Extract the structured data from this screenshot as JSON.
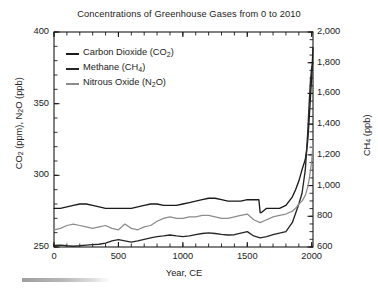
{
  "chart_data": {
    "type": "line",
    "title": "Concentrations of Greenhouse Gases from 0 to 2010",
    "xlabel": "Year, CE",
    "ylabel_left": "CO2 (ppm), N2O (ppb)",
    "ylabel_right": "CH4 (ppb)",
    "xlim": [
      0,
      2010
    ],
    "ylim_left": [
      250,
      400
    ],
    "ylim_right": [
      600,
      2000
    ],
    "xticks": [
      0,
      500,
      1000,
      1500,
      2000
    ],
    "xtick_labels": [
      "0",
      "500",
      "1000",
      "1500",
      "2000"
    ],
    "yticks_left": [
      250,
      300,
      350,
      400
    ],
    "ytick_labels_left": [
      "250",
      "300",
      "350",
      "400"
    ],
    "yticks_right": [
      600,
      800,
      1000,
      1200,
      1400,
      1600,
      1800,
      2000
    ],
    "ytick_labels_right": [
      "600",
      "800",
      "1,000",
      "1,200",
      "1,400",
      "1,600",
      "1,800",
      "2,000"
    ],
    "minor_tick_x_step": 100,
    "minor_tick_y_left_step": 10,
    "minor_tick_y_right_step": 50,
    "grid": false,
    "legend_position": "upper-left-inside",
    "legend": [
      {
        "label": "Carbon Dioxide (CO2)",
        "color": "#1a1a1a",
        "axis": "left",
        "unit": "ppm"
      },
      {
        "label": "Methane (CH4)",
        "color": "#262626",
        "axis": "right",
        "unit": "ppb"
      },
      {
        "label": "Nitrous Oxide (N2O)",
        "color": "#8c8c8c",
        "axis": "left",
        "unit": "ppb"
      }
    ],
    "series": [
      {
        "name": "Carbon Dioxide (CO2)",
        "color": "#1a1a1a",
        "axis": "left",
        "unit": "ppm",
        "x": [
          0,
          50,
          100,
          150,
          200,
          250,
          300,
          350,
          400,
          450,
          500,
          550,
          600,
          650,
          700,
          750,
          800,
          850,
          900,
          950,
          1000,
          1050,
          1100,
          1150,
          1200,
          1250,
          1300,
          1350,
          1400,
          1450,
          1500,
          1550,
          1590,
          1600,
          1610,
          1650,
          1700,
          1750,
          1800,
          1850,
          1875,
          1900,
          1925,
          1950,
          1960,
          1970,
          1980,
          1990,
          2000,
          2010
        ],
        "y": [
          277,
          277,
          278,
          279,
          280,
          280,
          279,
          278,
          277,
          277,
          277,
          277,
          277,
          278,
          279,
          280,
          280,
          279,
          279,
          279,
          280,
          281,
          282,
          283,
          284,
          284,
          283,
          282,
          282,
          282,
          283,
          283,
          283,
          274,
          274,
          277,
          277,
          277,
          279,
          285,
          290,
          296,
          304,
          311,
          317,
          325,
          339,
          354,
          369,
          389
        ]
      },
      {
        "name": "Methane (CH4)",
        "color": "#262626",
        "axis": "right",
        "unit": "ppb",
        "x": [
          0,
          50,
          100,
          150,
          200,
          250,
          300,
          350,
          400,
          450,
          500,
          550,
          600,
          650,
          700,
          750,
          800,
          850,
          900,
          950,
          1000,
          1050,
          1100,
          1150,
          1200,
          1250,
          1300,
          1350,
          1400,
          1450,
          1500,
          1550,
          1600,
          1650,
          1700,
          1750,
          1800,
          1850,
          1875,
          1900,
          1925,
          1950,
          1960,
          1970,
          1980,
          1990,
          2000,
          2010
        ],
        "y": [
          610,
          612,
          608,
          605,
          608,
          612,
          615,
          618,
          625,
          640,
          648,
          640,
          632,
          640,
          650,
          660,
          668,
          672,
          678,
          672,
          668,
          672,
          680,
          688,
          692,
          688,
          682,
          678,
          680,
          690,
          700,
          672,
          660,
          668,
          680,
          690,
          700,
          760,
          820,
          880,
          950,
          1100,
          1220,
          1360,
          1530,
          1680,
          1770,
          1800
        ]
      },
      {
        "name": "Nitrous Oxide (N2O)",
        "color": "#8c8c8c",
        "axis": "left",
        "unit": "ppb",
        "x": [
          0,
          50,
          100,
          150,
          200,
          250,
          300,
          350,
          400,
          450,
          500,
          550,
          600,
          650,
          700,
          750,
          800,
          850,
          900,
          950,
          1000,
          1050,
          1100,
          1150,
          1200,
          1250,
          1300,
          1350,
          1400,
          1450,
          1500,
          1550,
          1600,
          1650,
          1700,
          1750,
          1800,
          1850,
          1875,
          1900,
          1925,
          1950,
          1960,
          1970,
          1980,
          1990,
          2000,
          2010
        ],
        "y": [
          262,
          263,
          265,
          266,
          265,
          264,
          263,
          264,
          265,
          263,
          262,
          266,
          263,
          262,
          264,
          265,
          268,
          270,
          271,
          270,
          270,
          271,
          271,
          272,
          272,
          271,
          270,
          270,
          271,
          272,
          273,
          269,
          267,
          269,
          271,
          272,
          273,
          275,
          277,
          280,
          282,
          286,
          289,
          292,
          297,
          303,
          310,
          322
        ]
      }
    ]
  }
}
